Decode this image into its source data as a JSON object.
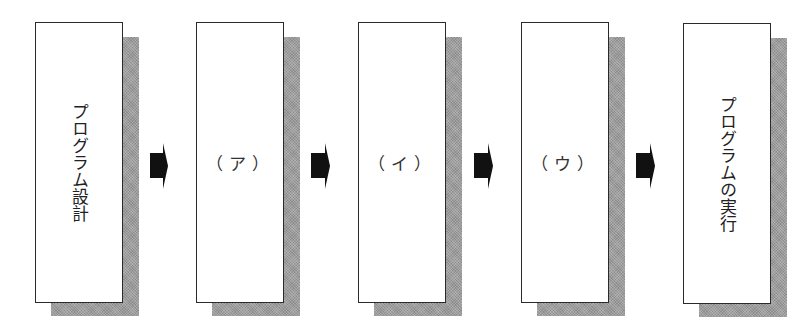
{
  "diagram": {
    "type": "process-flow",
    "direction": "left-to-right",
    "steps": [
      {
        "id": "step1",
        "label": "プログラム設計",
        "orientation": "vertical"
      },
      {
        "id": "step2",
        "label": "（ア）",
        "orientation": "horizontal"
      },
      {
        "id": "step3",
        "label": "（イ）",
        "orientation": "horizontal"
      },
      {
        "id": "step4",
        "label": "（ウ）",
        "orientation": "horizontal"
      },
      {
        "id": "step5",
        "label": "プログラムの実行",
        "orientation": "vertical"
      }
    ],
    "connectors": [
      {
        "from": "step1",
        "to": "step2",
        "icon": "block-arrow-right-icon"
      },
      {
        "from": "step2",
        "to": "step3",
        "icon": "block-arrow-right-icon"
      },
      {
        "from": "step3",
        "to": "step4",
        "icon": "block-arrow-right-icon"
      },
      {
        "from": "step4",
        "to": "step5",
        "icon": "block-arrow-right-icon"
      }
    ],
    "colors": {
      "box_border": "#2a2a2a",
      "box_fill": "#ffffff",
      "shadow": "#9c9c9c",
      "arrow": "#111111"
    }
  }
}
